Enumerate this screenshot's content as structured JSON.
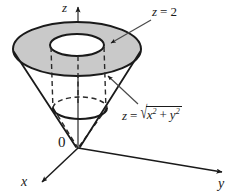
{
  "figure": {
    "kind": "math-3d-solid-region",
    "background_color": "#ffffff",
    "ink_color": "#1a1a1a",
    "shade_color": "#c9c9c9"
  },
  "axes": {
    "z_label": "z",
    "x_label": "x",
    "y_label": "y",
    "origin_label": "0"
  },
  "annotations": {
    "plane": {
      "name": "plane-label",
      "text": "z = 2",
      "lhs": "z",
      "eq": "=",
      "rhs": "2"
    },
    "cone": {
      "name": "cone-label",
      "text": "z = √(x² + y²)",
      "lhs": "z",
      "eq": "=",
      "radical_sign": "√",
      "radicand_x": "x",
      "radicand_x_exp": "2",
      "radicand_plus": "+",
      "radicand_y": "y",
      "radicand_y_exp": "2"
    }
  },
  "geometry": {
    "top_outer_ellipse": {
      "cx": 77,
      "cy": 49,
      "rx": 64,
      "ry": 27
    },
    "top_inner_ellipse": {
      "cx": 77,
      "cy": 45,
      "rx": 27,
      "ry": 11
    },
    "lower_ellipse": {
      "cx": 80,
      "cy": 108,
      "rx": 27,
      "ry": 11
    },
    "apex": {
      "x": 78,
      "y": 148
    },
    "z_axis_tip": {
      "x": 78,
      "y": 3
    },
    "x_axis_tip": {
      "x": 38,
      "y": 184
    },
    "y_axis_tip": {
      "x": 228,
      "y": 174
    }
  }
}
